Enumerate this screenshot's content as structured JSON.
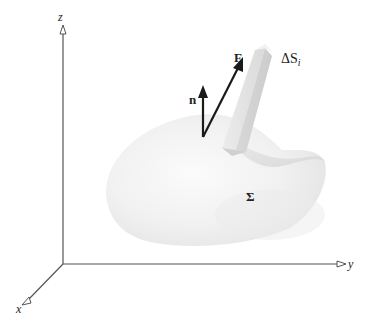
{
  "diagram": {
    "axes": {
      "x_label": "x",
      "y_label": "y",
      "z_label": "z"
    },
    "vectors": {
      "normal_label": "n",
      "field_label": "F"
    },
    "surface_element_label": "ΔS",
    "surface_element_subscript": "i",
    "surface_label": "Σ",
    "colors": {
      "axis": "#555555",
      "vector": "#1a1a1a",
      "surface_light": "#f4f4f4",
      "surface_shadow": "#dcdcdc",
      "prism": "#e2e2e2"
    }
  }
}
